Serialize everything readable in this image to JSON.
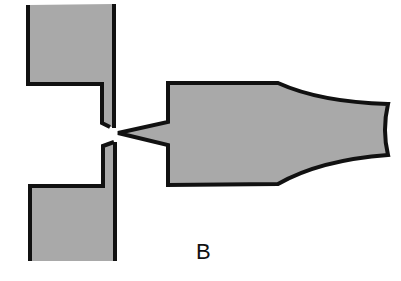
{
  "diagram": {
    "label": "B",
    "colors": {
      "fill": "#a9a9a9",
      "stroke": "#111111",
      "background": "#ffffff"
    },
    "parts": [
      {
        "name": "upper-electrode",
        "shape": "L-block"
      },
      {
        "name": "lower-electrode",
        "shape": "L-block"
      },
      {
        "name": "tapered-tip-body",
        "shape": "body with pointed tip and flared end"
      }
    ]
  }
}
